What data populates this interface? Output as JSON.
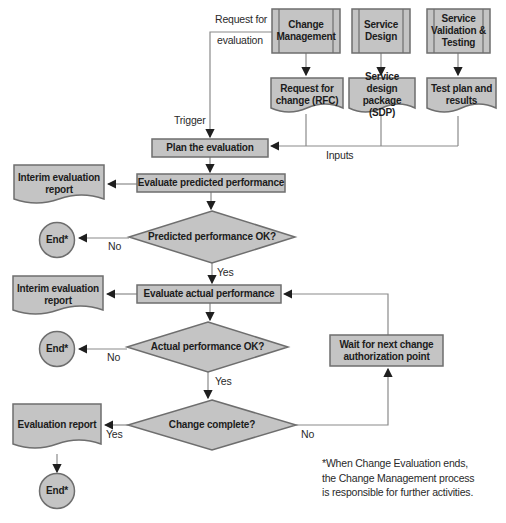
{
  "colors": {
    "shape_fill": "#c4c4c4",
    "shape_border": "#6e6e6e",
    "connector_line": "#8a8a8a",
    "arrowhead": "#1f1f1f",
    "text": "#1c1c1c",
    "background": "#ffffff"
  },
  "sources": [
    {
      "label": "Change Management"
    },
    {
      "label": "Service Design"
    },
    {
      "label": "Service Validation & Testing"
    }
  ],
  "input_documents": [
    {
      "label": "Request for change (RFC)"
    },
    {
      "label": "Service design package (SDP)"
    },
    {
      "label": "Test plan and results"
    }
  ],
  "activities": {
    "plan": "Plan the evaluation",
    "evaluate_predicted": "Evaluate predicted performance",
    "evaluate_actual": "Evaluate actual performance",
    "wait": "Wait for next change authorization point"
  },
  "decisions": {
    "predicted": "Predicted performance OK?",
    "actual": "Actual performance OK?",
    "complete": "Change complete?"
  },
  "output_documents": {
    "interim1": "Interim evaluation report",
    "interim2": "Interim evaluation report",
    "final": "Evaluation report"
  },
  "terminators": {
    "end1": "End*",
    "end2": "End*",
    "end3": "End*"
  },
  "flow_labels": {
    "request_for": "Request for",
    "evaluation": "evaluation",
    "trigger": "Trigger",
    "inputs": "Inputs",
    "yes_predicted": "Yes",
    "no_predicted": "No",
    "yes_actual": "Yes",
    "no_actual": "No",
    "yes_complete": "Yes",
    "no_complete": "No"
  },
  "footnote": {
    "line1": "*When Change Evaluation ends,",
    "line2": "the Change Management process",
    "line3": "is responsible for further activities."
  }
}
